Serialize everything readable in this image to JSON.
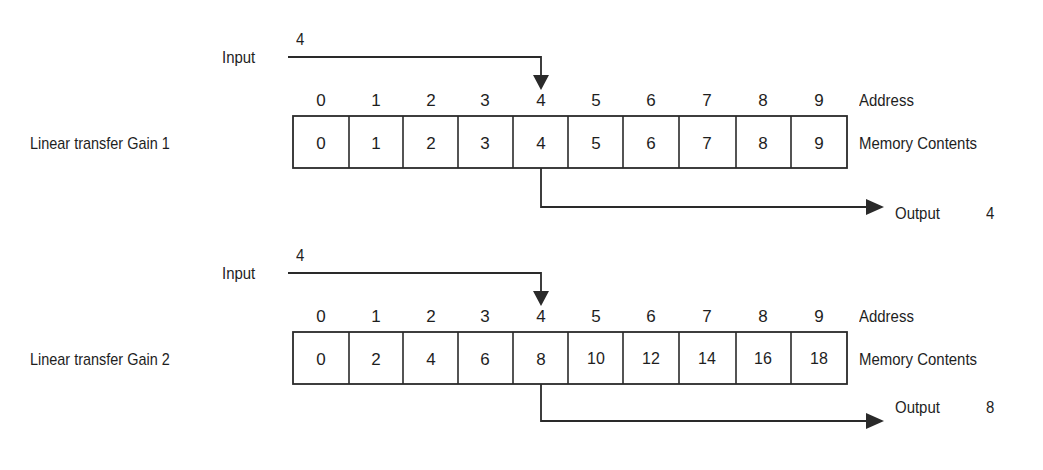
{
  "diagrams": [
    {
      "title": "Linear transfer Gain 1",
      "gain": 1,
      "input_label": "Input",
      "input_value": "4",
      "address_label": "Address",
      "memory_label": "Memory Contents",
      "addresses": [
        "0",
        "1",
        "2",
        "3",
        "4",
        "5",
        "6",
        "7",
        "8",
        "9"
      ],
      "contents": [
        "0",
        "1",
        "2",
        "3",
        "4",
        "5",
        "6",
        "7",
        "8",
        "9"
      ],
      "selected_address": 4,
      "output_label": "Output",
      "output_value": "4"
    },
    {
      "title": "Linear transfer Gain 2",
      "gain": 2,
      "input_label": "Input",
      "input_value": "4",
      "address_label": "Address",
      "memory_label": "Memory Contents",
      "addresses": [
        "0",
        "1",
        "2",
        "3",
        "4",
        "5",
        "6",
        "7",
        "8",
        "9"
      ],
      "contents": [
        "0",
        "2",
        "4",
        "6",
        "8",
        "10",
        "12",
        "14",
        "16",
        "18"
      ],
      "selected_address": 4,
      "output_label": "Output",
      "output_value": "8"
    }
  ],
  "colors": {
    "line": "#2a2a2a",
    "text": "#1e1e1e",
    "background": "#ffffff"
  }
}
